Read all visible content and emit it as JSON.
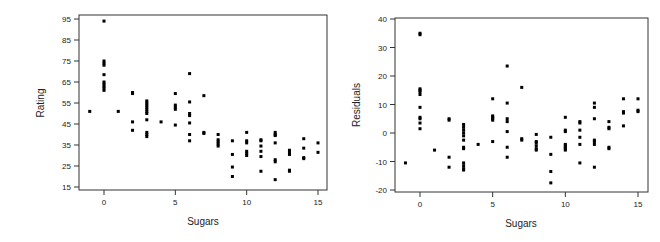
{
  "chart_data": [
    {
      "type": "scatter",
      "title": "",
      "xlabel": "Sugars",
      "ylabel": "Rating",
      "xlim": [
        -1.5,
        15.5
      ],
      "ylim": [
        14,
        96
      ],
      "xticks": [
        0,
        5,
        10,
        15
      ],
      "yticks": [
        15,
        25,
        35,
        45,
        55,
        65,
        75,
        85,
        95
      ],
      "grid": false,
      "legend": null,
      "marker": "square",
      "color": "#000000",
      "points": [
        [
          -1,
          51
        ],
        [
          0,
          94
        ],
        [
          0,
          75
        ],
        [
          0,
          74
        ],
        [
          0,
          73
        ],
        [
          0,
          68.5
        ],
        [
          0,
          65
        ],
        [
          0,
          64
        ],
        [
          0,
          63
        ],
        [
          0,
          62
        ],
        [
          0,
          61
        ],
        [
          1,
          51
        ],
        [
          2,
          60
        ],
        [
          2,
          59.5
        ],
        [
          2,
          46
        ],
        [
          2,
          42
        ],
        [
          3,
          56
        ],
        [
          3,
          55
        ],
        [
          3,
          54
        ],
        [
          3,
          53
        ],
        [
          3,
          52
        ],
        [
          3,
          51
        ],
        [
          3,
          50
        ],
        [
          3,
          47
        ],
        [
          3,
          41
        ],
        [
          3,
          40
        ],
        [
          3,
          39
        ],
        [
          4,
          46
        ],
        [
          5,
          59.5
        ],
        [
          5,
          54
        ],
        [
          5,
          53
        ],
        [
          5,
          52
        ],
        [
          5,
          44.5
        ],
        [
          6,
          69
        ],
        [
          6,
          55.5
        ],
        [
          6,
          50
        ],
        [
          6,
          49
        ],
        [
          6,
          45.5
        ],
        [
          6,
          40
        ],
        [
          6,
          37
        ],
        [
          7,
          58.5
        ],
        [
          7,
          41
        ],
        [
          7,
          40.5
        ],
        [
          8,
          40
        ],
        [
          8,
          37.5
        ],
        [
          8,
          36.5
        ],
        [
          8,
          35.5
        ],
        [
          8,
          34.5
        ],
        [
          9,
          37
        ],
        [
          9,
          30.5
        ],
        [
          9,
          24.5
        ],
        [
          9,
          20
        ],
        [
          10,
          41
        ],
        [
          10,
          37
        ],
        [
          10,
          36
        ],
        [
          10,
          32
        ],
        [
          10,
          31
        ],
        [
          10,
          30
        ],
        [
          11,
          37.5
        ],
        [
          11,
          37
        ],
        [
          11,
          34.5
        ],
        [
          11,
          32
        ],
        [
          11,
          29.5
        ],
        [
          11,
          22.5
        ],
        [
          12,
          41
        ],
        [
          12,
          40
        ],
        [
          12,
          39.5
        ],
        [
          12,
          36
        ],
        [
          12,
          28
        ],
        [
          12,
          27
        ],
        [
          12,
          18.5
        ],
        [
          13,
          32.5
        ],
        [
          13,
          31.5
        ],
        [
          13,
          30.5
        ],
        [
          13,
          23
        ],
        [
          13,
          22.5
        ],
        [
          14,
          38
        ],
        [
          14,
          33.5
        ],
        [
          14,
          29
        ],
        [
          14,
          28.5
        ],
        [
          15,
          36
        ],
        [
          15,
          31.5
        ]
      ]
    },
    {
      "type": "scatter",
      "title": "",
      "xlabel": "Sugars",
      "ylabel": "Residuals",
      "xlim": [
        -1.5,
        15.5
      ],
      "ylim": [
        -21,
        41
      ],
      "xticks": [
        0,
        5,
        10,
        15
      ],
      "yticks": [
        -20,
        -10,
        0,
        10,
        20,
        30,
        40
      ],
      "grid": false,
      "legend": null,
      "marker": "square",
      "color": "#000000",
      "points": [
        [
          -1,
          -10.5
        ],
        [
          0,
          35
        ],
        [
          0,
          34.5
        ],
        [
          0,
          15.5
        ],
        [
          0,
          15
        ],
        [
          0,
          14.5
        ],
        [
          0,
          13.5
        ],
        [
          0,
          9
        ],
        [
          0,
          5.5
        ],
        [
          0,
          5
        ],
        [
          0,
          3.5
        ],
        [
          0,
          1.5
        ],
        [
          1,
          -6
        ],
        [
          2,
          5
        ],
        [
          2,
          4.5
        ],
        [
          2,
          -8.5
        ],
        [
          2,
          -12
        ],
        [
          3,
          3
        ],
        [
          3,
          2
        ],
        [
          3,
          1
        ],
        [
          3,
          0
        ],
        [
          3,
          -1
        ],
        [
          3,
          -2.5
        ],
        [
          3,
          -5
        ],
        [
          3,
          -5.5
        ],
        [
          3,
          -10.5
        ],
        [
          3,
          -11.5
        ],
        [
          3,
          -12.5
        ],
        [
          3,
          -13
        ],
        [
          4,
          -4
        ],
        [
          5,
          12
        ],
        [
          5,
          6
        ],
        [
          5,
          5.5
        ],
        [
          5,
          5
        ],
        [
          5,
          4.5
        ],
        [
          5,
          -3
        ],
        [
          6,
          23.5
        ],
        [
          6,
          10.5
        ],
        [
          6,
          5
        ],
        [
          6,
          4
        ],
        [
          6,
          0.5
        ],
        [
          6,
          -5
        ],
        [
          6,
          -8.5
        ],
        [
          7,
          16
        ],
        [
          7,
          -2
        ],
        [
          7,
          -2.5
        ],
        [
          8,
          -0.5
        ],
        [
          8,
          -3
        ],
        [
          8,
          -3.5
        ],
        [
          8,
          -4.5
        ],
        [
          8,
          -5.5
        ],
        [
          8,
          -6
        ],
        [
          9,
          -1.5
        ],
        [
          9,
          -7.5
        ],
        [
          9,
          -13.5
        ],
        [
          9,
          -17.5
        ],
        [
          10,
          5.5
        ],
        [
          10,
          1
        ],
        [
          10,
          0.5
        ],
        [
          10,
          -4
        ],
        [
          10,
          -4.5
        ],
        [
          10,
          -5
        ],
        [
          10,
          -5.5
        ],
        [
          10,
          -6
        ],
        [
          11,
          4
        ],
        [
          11,
          3.5
        ],
        [
          11,
          1
        ],
        [
          11,
          -1.5
        ],
        [
          11,
          -4
        ],
        [
          11,
          -10.5
        ],
        [
          12,
          10.5
        ],
        [
          12,
          9
        ],
        [
          12,
          5
        ],
        [
          12,
          -2.5
        ],
        [
          12,
          -3
        ],
        [
          12,
          -4
        ],
        [
          12,
          -12
        ],
        [
          13,
          4
        ],
        [
          13,
          2
        ],
        [
          13,
          1.5
        ],
        [
          13,
          -5
        ],
        [
          13,
          -5.5
        ],
        [
          14,
          12
        ],
        [
          14,
          7.5
        ],
        [
          14,
          7
        ],
        [
          14,
          2.5
        ],
        [
          15,
          12
        ],
        [
          15,
          8
        ],
        [
          15,
          7.5
        ]
      ]
    }
  ],
  "plots": {
    "left": {
      "xlabel": "Sugars",
      "ylabel": "Rating",
      "xtick_labels": [
        "0",
        "5",
        "10",
        "15"
      ],
      "ytick_labels": [
        "15",
        "25",
        "35",
        "45",
        "55",
        "65",
        "75",
        "85",
        "95"
      ]
    },
    "right": {
      "xlabel": "Sugars",
      "ylabel": "Residuals",
      "xtick_labels": [
        "0",
        "5",
        "10",
        "15"
      ],
      "ytick_labels": [
        "-20",
        "-10",
        "0",
        "10",
        "20",
        "30",
        "40"
      ]
    }
  }
}
